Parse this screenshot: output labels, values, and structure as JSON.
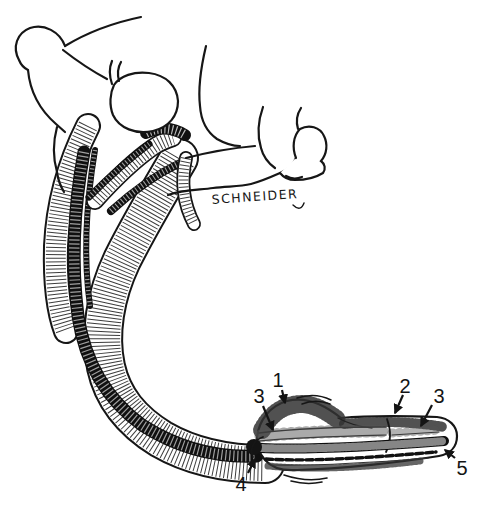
{
  "figure": {
    "kind": "hand-drawn anatomical line illustration",
    "signature": "SCHNEIDER",
    "colors": {
      "ink": "#161616",
      "background": "#ffffff"
    },
    "callouts": [
      {
        "id": "3-left",
        "text": "3"
      },
      {
        "id": "1",
        "text": "1"
      },
      {
        "id": "2",
        "text": "2"
      },
      {
        "id": "3-right",
        "text": "3"
      },
      {
        "id": "5",
        "text": "5"
      },
      {
        "id": "4",
        "text": "4"
      }
    ]
  }
}
